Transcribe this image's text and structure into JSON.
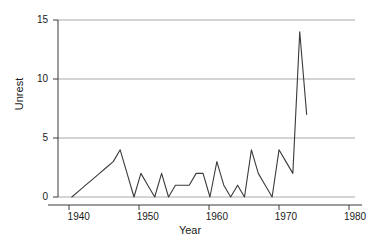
{
  "chart_data": {
    "type": "line",
    "title": "",
    "xlabel": "Year",
    "ylabel": "Unrest",
    "xlim": [
      1937,
      1980
    ],
    "ylim": [
      0,
      15
    ],
    "grid": true,
    "legend": null,
    "xticks": [
      1940,
      1950,
      1960,
      1970,
      1980
    ],
    "xtick_labels": [
      "1940",
      "1950",
      "1960",
      "1970",
      "1980"
    ],
    "yticks": [
      0,
      5,
      10,
      15
    ],
    "ytick_labels": [
      "0",
      "5",
      "10",
      "15"
    ],
    "series": [
      {
        "name": "Unrest",
        "color": "#3a3a3a",
        "x": [
          1939,
          1940,
          1941,
          1942,
          1943,
          1944,
          1945,
          1946,
          1947,
          1948,
          1949,
          1950,
          1951,
          1952,
          1953,
          1954,
          1955,
          1956,
          1957,
          1958,
          1959,
          1960,
          1961,
          1962,
          1963,
          1964,
          1965,
          1966,
          1967,
          1968,
          1969,
          1970,
          1971,
          1972,
          1973
        ],
        "values": [
          0,
          0.5,
          1,
          1.5,
          2,
          2.5,
          3,
          4,
          2,
          0,
          2,
          1,
          0,
          2,
          0,
          1,
          1,
          1,
          2,
          2,
          0,
          3,
          1,
          0,
          1,
          0,
          4,
          2,
          1,
          0,
          4,
          3,
          2,
          14,
          7
        ]
      }
    ]
  },
  "axes": {
    "y_title": "Unrest",
    "x_title": "Year"
  }
}
